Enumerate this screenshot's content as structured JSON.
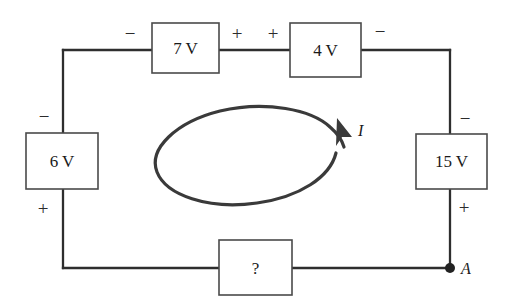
{
  "diagram": {
    "type": "circuit-schematic",
    "ink_color": "#2e2e2e",
    "background_color": "#ffffff"
  },
  "components": {
    "top_left": {
      "name": "source-7v",
      "label": "7 V",
      "left_terminal_sign": "−",
      "right_terminal_sign": "+"
    },
    "top_right": {
      "name": "source-4v",
      "label": "4 V",
      "left_terminal_sign": "+",
      "right_terminal_sign": "−"
    },
    "left": {
      "name": "source-6v",
      "label": "6 V",
      "top_terminal_sign": "−",
      "bottom_terminal_sign": "+"
    },
    "right": {
      "name": "source-15v",
      "label": "15 V",
      "top_terminal_sign": "−",
      "bottom_terminal_sign": "+"
    },
    "bottom": {
      "name": "unknown-element",
      "label": "?"
    }
  },
  "annotations": {
    "current_label": "I",
    "node_label": "A"
  }
}
